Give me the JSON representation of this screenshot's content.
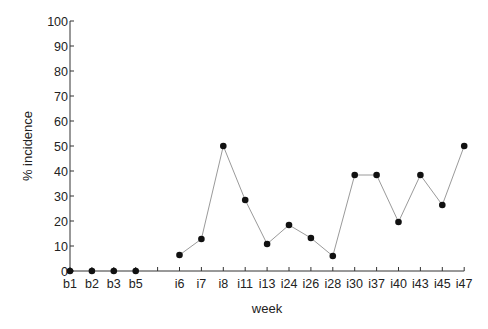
{
  "chart_data": {
    "type": "line",
    "title": "",
    "xlabel": "week",
    "ylabel": "% incidence",
    "ylim": [
      0,
      100
    ],
    "yticks": [
      0,
      10,
      20,
      30,
      40,
      50,
      60,
      70,
      80,
      90,
      100
    ],
    "grid": false,
    "legend": null,
    "categories": [
      "b1",
      "b2",
      "b3",
      "b5",
      "",
      "i6",
      "i7",
      "i8",
      "i11",
      "i13",
      "i24",
      "i26",
      "i28",
      "i30",
      "i37",
      "i40",
      "i43",
      "i45",
      "i47"
    ],
    "series": [
      {
        "name": "baseline",
        "connected": false,
        "x": [
          "b1",
          "b2",
          "b3",
          "b5"
        ],
        "values": [
          0,
          0,
          0,
          0
        ]
      },
      {
        "name": "incidence",
        "connected": true,
        "x": [
          "i6",
          "i7",
          "i8",
          "i11",
          "i13",
          "i24",
          "i26",
          "i28",
          "i30",
          "i37",
          "i40",
          "i43",
          "i45",
          "i47"
        ],
        "values": [
          6.4,
          12.8,
          50,
          28.4,
          10.8,
          18.4,
          13.2,
          6,
          38.4,
          38.4,
          19.6,
          38.4,
          26.4,
          50
        ]
      }
    ],
    "colors": {
      "axis": "#333333",
      "line": "#9a9a9a",
      "marker": "#111111",
      "text": "#222222"
    }
  }
}
